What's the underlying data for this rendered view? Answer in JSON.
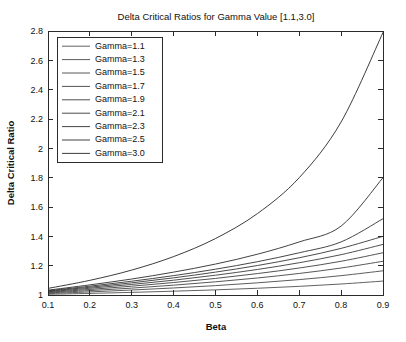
{
  "chart_data": {
    "type": "line",
    "title": "Delta Critical Ratios for Gamma Value [1.1,3.0]",
    "xlabel": "Beta",
    "ylabel": "Delta Critical Ratio",
    "xlim": [
      0.1,
      0.9
    ],
    "ylim": [
      1.0,
      2.8
    ],
    "xticks": [
      0.1,
      0.2,
      0.3,
      0.4,
      0.5,
      0.6,
      0.7,
      0.8,
      0.9
    ],
    "xticklabels": [
      "0.1",
      "0.2",
      "0.3",
      "0.4",
      "0.5",
      "0.6",
      "0.7",
      "0.8",
      "0.9"
    ],
    "yticks": [
      1.0,
      1.2,
      1.4,
      1.6,
      1.8,
      2.0,
      2.2,
      2.4,
      2.6,
      2.8
    ],
    "yticklabels": [
      "1",
      "1.2",
      "1.4",
      "1.6",
      "1.8",
      "2",
      "2.2",
      "2.4",
      "2.6",
      "2.8"
    ],
    "grid": false,
    "legend_position": "upper-left",
    "x": [
      0.1,
      0.2,
      0.3,
      0.4,
      0.5,
      0.6,
      0.7,
      0.8,
      0.9
    ],
    "series": [
      {
        "name": "Gamma=1.1",
        "color": "#4f4f4f",
        "values": [
          1.005,
          1.011,
          1.018,
          1.026,
          1.035,
          1.046,
          1.059,
          1.075,
          1.095
        ]
      },
      {
        "name": "Gamma=1.3",
        "color": "#4a4a4a",
        "values": [
          1.01,
          1.021,
          1.034,
          1.048,
          1.064,
          1.083,
          1.105,
          1.132,
          1.165
        ]
      },
      {
        "name": "Gamma=1.5",
        "color": "#454545",
        "values": [
          1.014,
          1.03,
          1.047,
          1.067,
          1.09,
          1.116,
          1.147,
          1.184,
          1.23
        ]
      },
      {
        "name": "Gamma=1.7",
        "color": "#404040",
        "values": [
          1.018,
          1.038,
          1.06,
          1.085,
          1.113,
          1.146,
          1.184,
          1.23,
          1.288
        ]
      },
      {
        "name": "Gamma=1.9",
        "color": "#3b3b3b",
        "values": [
          1.022,
          1.046,
          1.072,
          1.101,
          1.135,
          1.174,
          1.22,
          1.275,
          1.345
        ]
      },
      {
        "name": "Gamma=2.1",
        "color": "#363636",
        "values": [
          1.026,
          1.053,
          1.083,
          1.117,
          1.156,
          1.201,
          1.254,
          1.318,
          1.4
        ]
      },
      {
        "name": "Gamma=2.3",
        "color": "#313131",
        "values": [
          1.029,
          1.06,
          1.094,
          1.132,
          1.176,
          1.227,
          1.288,
          1.362,
          1.52
        ]
      },
      {
        "name": "Gamma=2.5",
        "color": "#2c2c2c",
        "values": [
          1.033,
          1.069,
          1.109,
          1.156,
          1.211,
          1.278,
          1.362,
          1.47,
          1.8
        ]
      },
      {
        "name": "Gamma=3.0",
        "color": "#272727",
        "values": [
          1.045,
          1.1,
          1.17,
          1.262,
          1.385,
          1.555,
          1.8,
          2.18,
          2.79
        ]
      }
    ]
  }
}
